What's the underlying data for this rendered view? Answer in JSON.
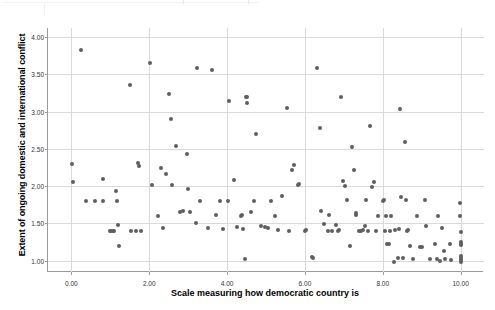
{
  "chart_data": {
    "type": "scatter",
    "title": "",
    "xlabel": "Scale measuring how democratic country is",
    "ylabel": "Extent of ongoing domestic and international conflict",
    "xlim": [
      -0.6,
      10.6
    ],
    "ylim": [
      0.85,
      4.12
    ],
    "xticks": [
      "0.00",
      "2.00",
      "4.00",
      "6.00",
      "8.00",
      "10.00"
    ],
    "xtick_values": [
      0,
      2,
      4,
      6,
      8,
      10
    ],
    "yticks": [
      "1.00",
      "1.50",
      "2.00",
      "2.50",
      "3.00",
      "3.50",
      "4.00"
    ],
    "ytick_values": [
      1.0,
      1.5,
      2.0,
      2.5,
      3.0,
      3.5,
      4.0
    ],
    "grid": true,
    "legend": "none",
    "marker_color": "#5f5f5f",
    "marker_size": 4,
    "points": [
      [
        0.02,
        2.3
      ],
      [
        0.03,
        2.06
      ],
      [
        0.25,
        3.83
      ],
      [
        0.38,
        1.8
      ],
      [
        0.62,
        1.8
      ],
      [
        0.8,
        2.09
      ],
      [
        0.82,
        1.8
      ],
      [
        0.98,
        1.4
      ],
      [
        1.02,
        1.4
      ],
      [
        1.06,
        1.4
      ],
      [
        1.1,
        1.4
      ],
      [
        1.15,
        1.94
      ],
      [
        1.18,
        1.8
      ],
      [
        1.2,
        1.48
      ],
      [
        1.22,
        1.2
      ],
      [
        1.5,
        3.36
      ],
      [
        1.52,
        1.4
      ],
      [
        1.66,
        1.4
      ],
      [
        1.72,
        2.31
      ],
      [
        1.73,
        2.27
      ],
      [
        1.78,
        1.4
      ],
      [
        2.02,
        3.65
      ],
      [
        2.08,
        2.01
      ],
      [
        2.22,
        1.6
      ],
      [
        2.3,
        2.25
      ],
      [
        2.35,
        1.44
      ],
      [
        2.42,
        2.16
      ],
      [
        2.52,
        3.23
      ],
      [
        2.56,
        2.9
      ],
      [
        2.58,
        2.01
      ],
      [
        2.7,
        2.54
      ],
      [
        2.78,
        1.65
      ],
      [
        2.88,
        1.67
      ],
      [
        2.96,
        2.43
      ],
      [
        3.0,
        1.96
      ],
      [
        3.05,
        1.65
      ],
      [
        3.2,
        1.5
      ],
      [
        3.22,
        3.58
      ],
      [
        3.3,
        1.8
      ],
      [
        3.5,
        1.44
      ],
      [
        3.62,
        3.56
      ],
      [
        3.72,
        1.61
      ],
      [
        3.82,
        1.8
      ],
      [
        3.9,
        1.43
      ],
      [
        4.02,
        1.8
      ],
      [
        4.05,
        3.14
      ],
      [
        4.18,
        2.08
      ],
      [
        4.25,
        1.45
      ],
      [
        4.35,
        1.6
      ],
      [
        4.38,
        1.61
      ],
      [
        4.42,
        1.42
      ],
      [
        4.45,
        1.02
      ],
      [
        4.48,
        3.2
      ],
      [
        4.5,
        3.19
      ],
      [
        4.52,
        3.12
      ],
      [
        4.62,
        1.66
      ],
      [
        4.7,
        1.8
      ],
      [
        4.75,
        2.7
      ],
      [
        4.88,
        1.47
      ],
      [
        4.98,
        1.45
      ],
      [
        5.05,
        1.44
      ],
      [
        5.12,
        1.8
      ],
      [
        5.22,
        1.6
      ],
      [
        5.3,
        1.41
      ],
      [
        5.42,
        1.87
      ],
      [
        5.55,
        3.05
      ],
      [
        5.58,
        1.4
      ],
      [
        5.68,
        2.22
      ],
      [
        5.72,
        2.29
      ],
      [
        5.82,
        2.02
      ],
      [
        5.85,
        2.03
      ],
      [
        6.0,
        1.4
      ],
      [
        6.02,
        1.41
      ],
      [
        6.18,
        1.05
      ],
      [
        6.22,
        1.04
      ],
      [
        6.3,
        3.58
      ],
      [
        6.38,
        2.78
      ],
      [
        6.42,
        1.67
      ],
      [
        6.5,
        1.49
      ],
      [
        6.58,
        1.4
      ],
      [
        6.62,
        1.62
      ],
      [
        6.7,
        1.4
      ],
      [
        6.8,
        1.48
      ],
      [
        6.85,
        1.4
      ],
      [
        6.88,
        1.41
      ],
      [
        6.92,
        3.2
      ],
      [
        6.98,
        2.07
      ],
      [
        7.02,
        2.0
      ],
      [
        7.08,
        1.82
      ],
      [
        7.15,
        1.2
      ],
      [
        7.2,
        2.53
      ],
      [
        7.25,
        2.22
      ],
      [
        7.3,
        1.64
      ],
      [
        7.32,
        1.62
      ],
      [
        7.38,
        1.4
      ],
      [
        7.45,
        1.4
      ],
      [
        7.5,
        1.41
      ],
      [
        7.55,
        1.46
      ],
      [
        7.58,
        1.82
      ],
      [
        7.62,
        1.4
      ],
      [
        7.68,
        2.8
      ],
      [
        7.72,
        1.99
      ],
      [
        7.78,
        2.05
      ],
      [
        7.82,
        1.4
      ],
      [
        7.88,
        1.6
      ],
      [
        8.0,
        1.8
      ],
      [
        8.02,
        1.81
      ],
      [
        8.05,
        1.4
      ],
      [
        8.08,
        1.6
      ],
      [
        8.12,
        1.23
      ],
      [
        8.15,
        1.22
      ],
      [
        8.18,
        1.4
      ],
      [
        8.22,
        1.6
      ],
      [
        8.28,
        0.99
      ],
      [
        8.32,
        1.41
      ],
      [
        8.38,
        1.04
      ],
      [
        8.42,
        1.42
      ],
      [
        8.45,
        3.04
      ],
      [
        8.48,
        1.86
      ],
      [
        8.52,
        1.04
      ],
      [
        8.58,
        2.59
      ],
      [
        8.6,
        1.82
      ],
      [
        8.62,
        1.4
      ],
      [
        8.65,
        1.41
      ],
      [
        8.7,
        1.2
      ],
      [
        8.78,
        1.02
      ],
      [
        8.88,
        1.6
      ],
      [
        8.95,
        1.19
      ],
      [
        9.0,
        1.19
      ],
      [
        9.08,
        1.81
      ],
      [
        9.12,
        1.46
      ],
      [
        9.2,
        1.03
      ],
      [
        9.35,
        1.22
      ],
      [
        9.38,
        1.03
      ],
      [
        9.42,
        1.6
      ],
      [
        9.48,
        1.0
      ],
      [
        9.52,
        1.44
      ],
      [
        9.58,
        1.13
      ],
      [
        9.6,
        1.02
      ],
      [
        9.72,
        1.23
      ],
      [
        9.75,
        1.01
      ],
      [
        9.98,
        1.78
      ],
      [
        9.99,
        1.6
      ],
      [
        10.0,
        1.39
      ],
      [
        10.0,
        1.25
      ],
      [
        10.0,
        1.23
      ],
      [
        10.0,
        1.21
      ],
      [
        10.0,
        1.07
      ],
      [
        10.0,
        1.04
      ],
      [
        10.0,
        1.01
      ],
      [
        10.0,
        0.99
      ]
    ]
  }
}
